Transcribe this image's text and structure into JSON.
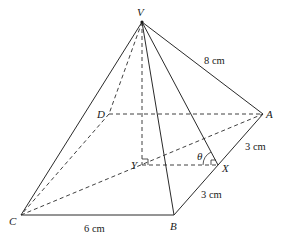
{
  "diagram": {
    "type": "square-based pyramid",
    "vertices": {
      "V": {
        "label": "V",
        "x": 142,
        "y": 22
      },
      "A": {
        "label": "A",
        "x": 263,
        "y": 114
      },
      "B": {
        "label": "B",
        "x": 174,
        "y": 215
      },
      "C": {
        "label": "C",
        "x": 21,
        "y": 215
      },
      "D": {
        "label": "D",
        "x": 109,
        "y": 114
      },
      "X": {
        "label": "X",
        "x": 218,
        "y": 165
      },
      "Y": {
        "label": "Y",
        "x": 142,
        "y": 165
      }
    },
    "lengths": {
      "VA": "8 cm",
      "AX": "3 cm",
      "XB": "3 cm",
      "CB": "6 cm"
    },
    "angle_label": "θ",
    "solid_edges": [
      "VA",
      "VB",
      "VC",
      "VX",
      "CB",
      "BA"
    ],
    "dashed_edges": [
      "VD",
      "VY",
      "DA",
      "DC",
      "CA",
      "YX"
    ],
    "right_angles": [
      "Y",
      "X"
    ]
  }
}
